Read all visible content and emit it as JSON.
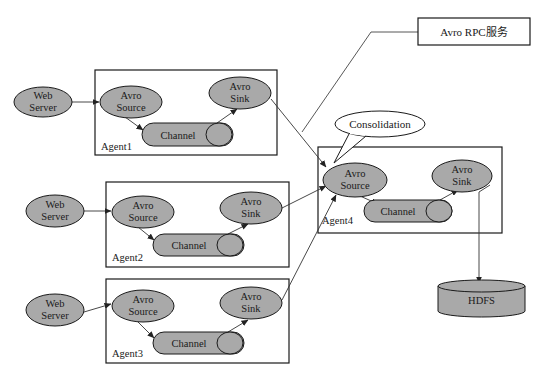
{
  "colors": {
    "node_fill": "#a9a9a9",
    "stroke": "#1a1a1a",
    "arrow": "#333333",
    "background": "#ffffff"
  },
  "rpc_box": {
    "label": "Avro RPC服务"
  },
  "consolidation": {
    "label": "Consolidation"
  },
  "hdfs": {
    "label": "HDFS"
  },
  "agents": [
    {
      "id": "agent1",
      "label": "Agent1",
      "web_server": {
        "line1": "Web",
        "line2": "Server"
      },
      "source": {
        "line1": "Avro",
        "line2": "Source"
      },
      "sink": {
        "line1": "Avro",
        "line2": "Sink"
      },
      "channel": {
        "label": "Channel"
      }
    },
    {
      "id": "agent2",
      "label": "Agent2",
      "web_server": {
        "line1": "Web",
        "line2": "Server"
      },
      "source": {
        "line1": "Avro",
        "line2": "Source"
      },
      "sink": {
        "line1": "Avro",
        "line2": "Sink"
      },
      "channel": {
        "label": "Channel"
      }
    },
    {
      "id": "agent3",
      "label": "Agent3",
      "web_server": {
        "line1": "Web",
        "line2": "Server"
      },
      "source": {
        "line1": "Avro",
        "line2": "Source"
      },
      "sink": {
        "line1": "Avro",
        "line2": "Sink"
      },
      "channel": {
        "label": "Channel"
      }
    },
    {
      "id": "agent4",
      "label": "Agent4",
      "source": {
        "line1": "Avro",
        "line2": "Source"
      },
      "sink": {
        "line1": "Avro",
        "line2": "Sink"
      },
      "channel": {
        "label": "Channel"
      }
    }
  ],
  "edges": [
    {
      "from": "Web Server (1)",
      "to": "Avro Source (Agent1)"
    },
    {
      "from": "Avro Source (Agent1)",
      "to": "Channel (Agent1)"
    },
    {
      "from": "Channel (Agent1)",
      "to": "Avro Sink (Agent1)"
    },
    {
      "from": "Avro Sink (Agent1)",
      "to": "Avro Source (Agent4)"
    },
    {
      "from": "Web Server (2)",
      "to": "Avro Source (Agent2)"
    },
    {
      "from": "Avro Source (Agent2)",
      "to": "Channel (Agent2)"
    },
    {
      "from": "Channel (Agent2)",
      "to": "Avro Sink (Agent2)"
    },
    {
      "from": "Avro Sink (Agent2)",
      "to": "Avro Source (Agent4)"
    },
    {
      "from": "Web Server (3)",
      "to": "Avro Source (Agent3)"
    },
    {
      "from": "Avro Source (Agent3)",
      "to": "Channel (Agent3)"
    },
    {
      "from": "Channel (Agent3)",
      "to": "Avro Sink (Agent3)"
    },
    {
      "from": "Avro Sink (Agent3)",
      "to": "Avro Source (Agent4)"
    },
    {
      "from": "Avro Source (Agent4)",
      "to": "Channel (Agent4)"
    },
    {
      "from": "Channel (Agent4)",
      "to": "Avro Sink (Agent4)"
    },
    {
      "from": "Avro Sink (Agent4)",
      "to": "HDFS"
    }
  ]
}
